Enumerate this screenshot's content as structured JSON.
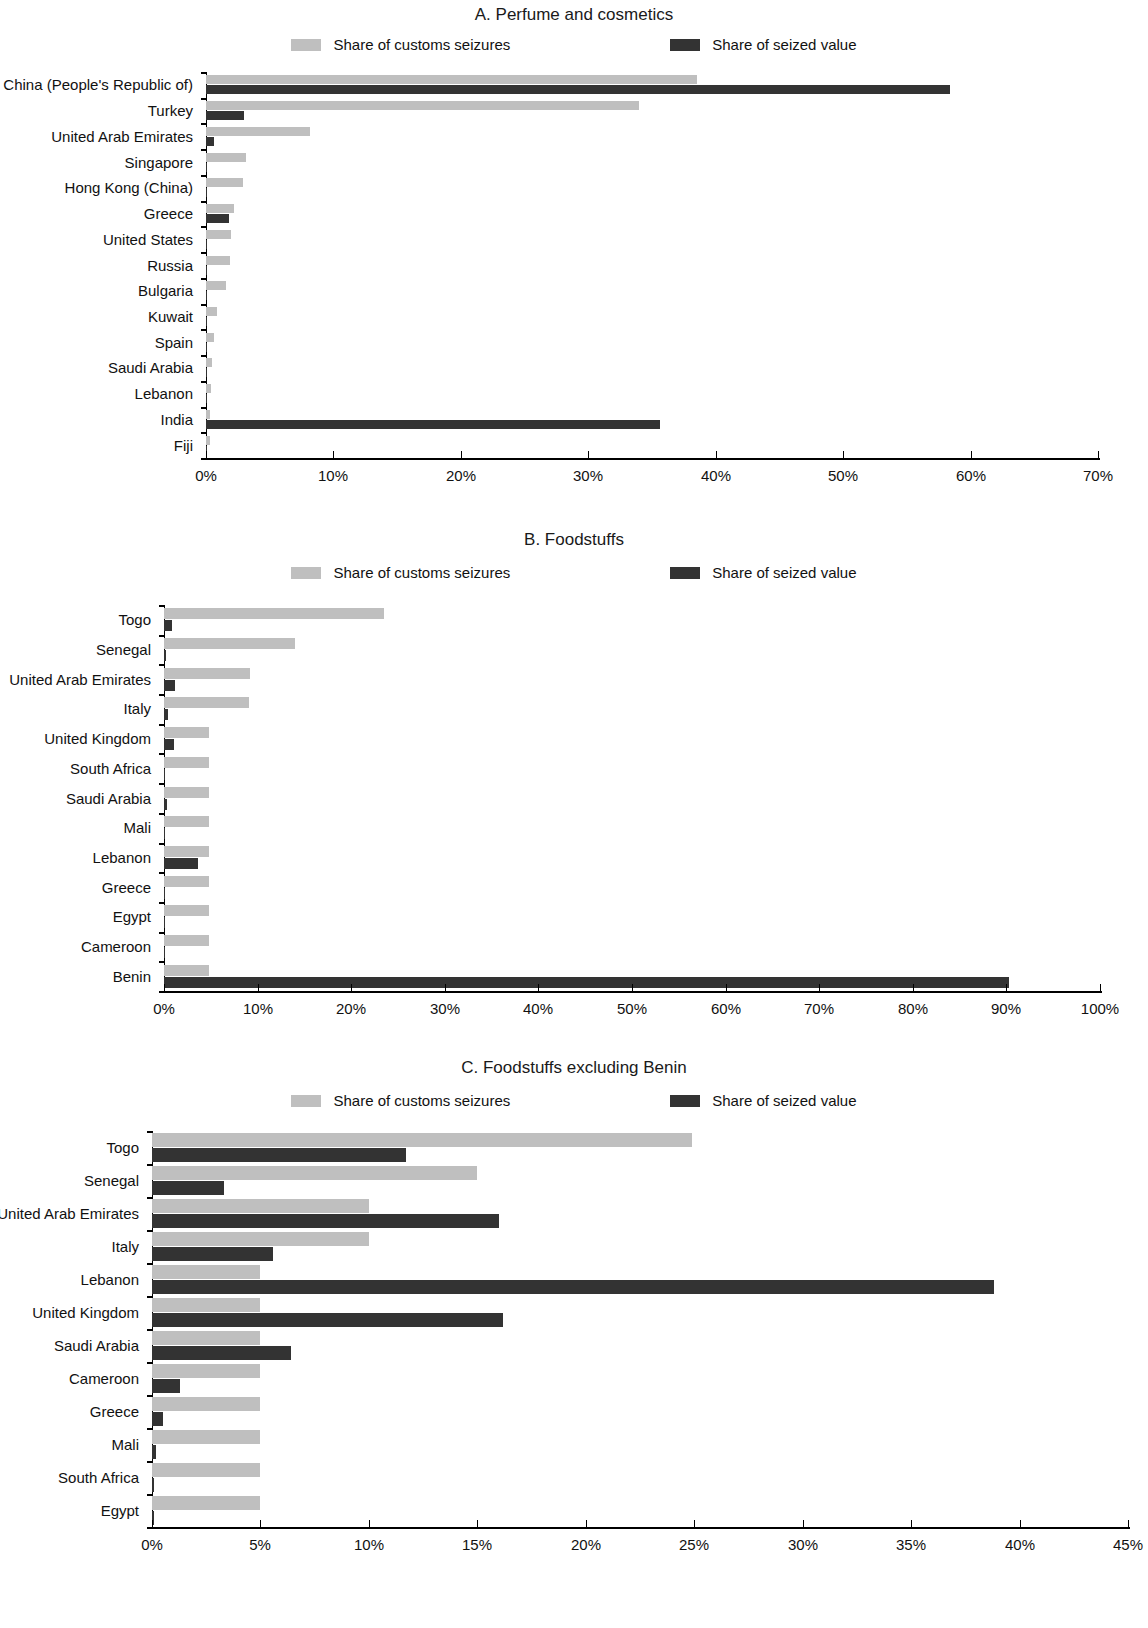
{
  "legend": {
    "series": [
      {
        "label": "Share of customs seizures",
        "color": "#bfbfbf",
        "key": "seizures"
      },
      {
        "label": "Share of seized value",
        "color": "#333333",
        "key": "value"
      }
    ]
  },
  "panels": [
    {
      "id": "A",
      "title": "A. Perfume and cosmetics"
    },
    {
      "id": "B",
      "title": "B. Foodstuffs"
    },
    {
      "id": "C",
      "title": "C. Foodstuffs excluding Benin"
    }
  ],
  "chart_data": [
    {
      "type": "bar",
      "orientation": "horizontal",
      "title": "A. Perfume and cosmetics",
      "xlabel": "",
      "ylabel": "",
      "xlim": [
        0,
        70
      ],
      "xticks": [
        0,
        10,
        20,
        30,
        40,
        50,
        60,
        70
      ],
      "xtick_labels": [
        "0%",
        "10%",
        "20%",
        "30%",
        "40%",
        "50%",
        "60%",
        "70%"
      ],
      "grid": false,
      "legend_position": "top",
      "categories": [
        "China (People's Republic of)",
        "Turkey",
        "United Arab Emirates",
        "Singapore",
        "Hong Kong (China)",
        "Greece",
        "United States",
        "Russia",
        "Bulgaria",
        "Kuwait",
        "Spain",
        "Saudi Arabia",
        "Lebanon",
        "India",
        "Fiji"
      ],
      "series": [
        {
          "name": "Share of customs seizures",
          "color": "#bfbfbf",
          "values": [
            38.5,
            34.0,
            8.2,
            3.1,
            2.9,
            2.2,
            2.0,
            1.9,
            1.6,
            0.9,
            0.6,
            0.5,
            0.4,
            0.3,
            0.3
          ]
        },
        {
          "name": "Share of seized value",
          "color": "#333333",
          "values": [
            58.4,
            3.0,
            0.6,
            0.1,
            0.1,
            1.8,
            0.1,
            0.1,
            0.1,
            0.1,
            0.1,
            0.1,
            0.1,
            35.6,
            0.1
          ]
        }
      ]
    },
    {
      "type": "bar",
      "orientation": "horizontal",
      "title": "B. Foodstuffs",
      "xlabel": "",
      "ylabel": "",
      "xlim": [
        0,
        100
      ],
      "xticks": [
        0,
        10,
        20,
        30,
        40,
        50,
        60,
        70,
        80,
        90,
        100
      ],
      "xtick_labels": [
        "0%",
        "10%",
        "20%",
        "30%",
        "40%",
        "50%",
        "60%",
        "70%",
        "80%",
        "90%",
        "100%"
      ],
      "grid": false,
      "legend_position": "top",
      "categories": [
        "Togo",
        "Senegal",
        "United Arab Emirates",
        "Italy",
        "United Kingdom",
        "South Africa",
        "Saudi Arabia",
        "Mali",
        "Lebanon",
        "Greece",
        "Egypt",
        "Cameroon",
        "Benin"
      ],
      "series": [
        {
          "name": "Share of customs seizures",
          "color": "#bfbfbf",
          "values": [
            23.5,
            14.0,
            9.2,
            9.1,
            4.8,
            4.8,
            4.8,
            4.8,
            4.8,
            4.8,
            4.8,
            4.8,
            4.8
          ]
        },
        {
          "name": "Share of seized value",
          "color": "#333333",
          "values": [
            0.9,
            0.2,
            1.2,
            0.4,
            1.1,
            0.1,
            0.3,
            0.1,
            3.6,
            0.1,
            0.1,
            0.1,
            90.3
          ]
        }
      ]
    },
    {
      "type": "bar",
      "orientation": "horizontal",
      "title": "C. Foodstuffs excluding Benin",
      "xlabel": "",
      "ylabel": "",
      "xlim": [
        0,
        45
      ],
      "xticks": [
        0,
        5,
        10,
        15,
        20,
        25,
        30,
        35,
        40,
        45
      ],
      "xtick_labels": [
        "0%",
        "5%",
        "10%",
        "15%",
        "20%",
        "25%",
        "30%",
        "35%",
        "40%",
        "45%"
      ],
      "grid": false,
      "legend_position": "top",
      "categories": [
        "Togo",
        "Senegal",
        "United Arab Emirates",
        "Italy",
        "Lebanon",
        "United Kingdom",
        "Saudi Arabia",
        "Cameroon",
        "Greece",
        "Mali",
        "South Africa",
        "Egypt"
      ],
      "series": [
        {
          "name": "Share of customs seizures",
          "color": "#bfbfbf",
          "values": [
            24.9,
            15.0,
            10.0,
            10.0,
            5.0,
            5.0,
            5.0,
            5.0,
            5.0,
            5.0,
            5.0,
            5.0
          ]
        },
        {
          "name": "Share of seized value",
          "color": "#333333",
          "values": [
            11.7,
            3.3,
            16.0,
            5.6,
            38.8,
            16.2,
            6.4,
            1.3,
            0.5,
            0.2,
            0.1,
            0.1
          ]
        }
      ]
    }
  ]
}
